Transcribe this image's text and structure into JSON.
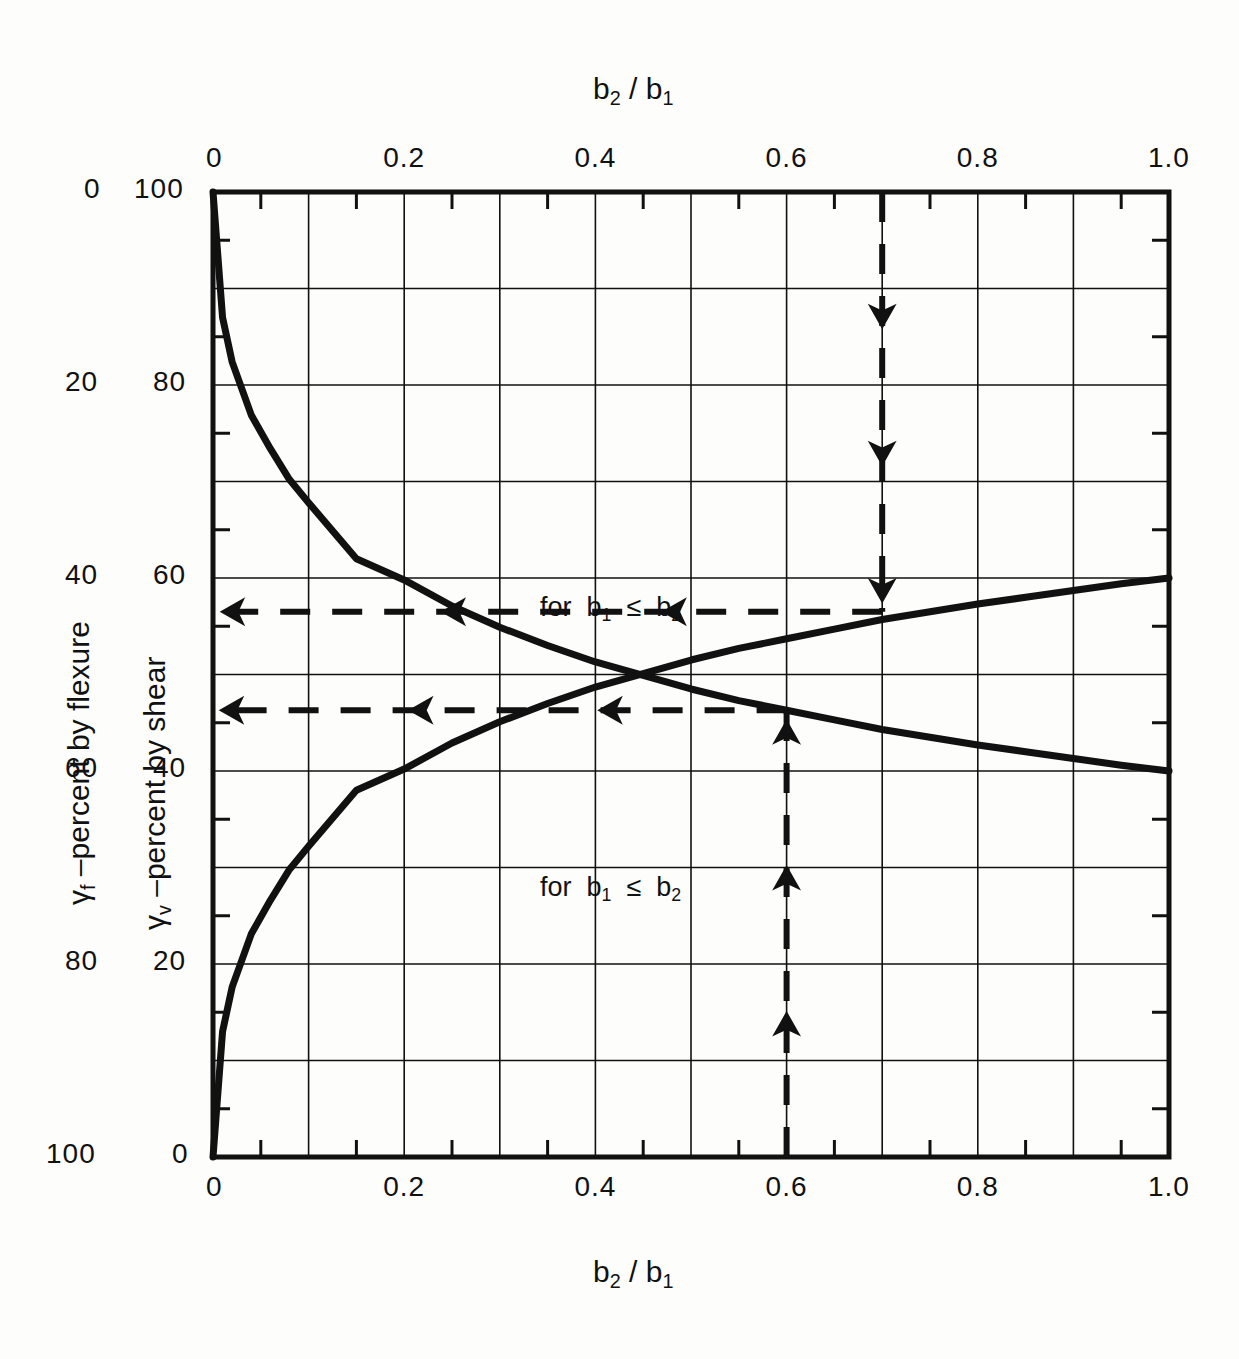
{
  "chart_data": {
    "type": "line",
    "title": "",
    "top_axis_label": "b2 / b1",
    "bottom_axis_label": "b2 / b1",
    "xlabel": "b2 / b1",
    "ylabel": "γv –percent by shear",
    "ylabel_outer": "γf –percent by flexure",
    "xlim": [
      0,
      1.0
    ],
    "ylim": [
      0,
      100
    ],
    "xticks": [
      0,
      0.2,
      0.4,
      0.6,
      0.8,
      1.0
    ],
    "xticklabels": [
      "0",
      "0.2",
      "0.4",
      "0.6",
      "0.8",
      "1.0"
    ],
    "x_major_grid_step": 0.1,
    "x_minor_tick_step": 0.05,
    "yticks_inner": [
      0,
      20,
      40,
      60,
      80,
      100
    ],
    "yticklabels_inner": [
      "0",
      "20",
      "40",
      "60",
      "80",
      "100"
    ],
    "yticks_outer": [
      100,
      80,
      60,
      40,
      20,
      0
    ],
    "yticklabels_outer": [
      "0",
      "20",
      "40",
      "60",
      "80",
      "100"
    ],
    "y_major_grid_step": 10,
    "y_minor_tick_step": 5,
    "grid": true,
    "legend": "none",
    "series": [
      {
        "name": "γv –percent by shear",
        "annotation": "for b1 ≤ b2",
        "formula": "gamma_v = 1 - 1/(1 + (2/3)*sqrt(b2/b1))",
        "x": [
          0.0,
          0.01,
          0.02,
          0.04,
          0.06,
          0.08,
          0.1,
          0.15,
          0.2,
          0.25,
          0.3,
          0.35,
          0.4,
          0.45,
          0.5,
          0.55,
          0.6,
          0.65,
          0.7,
          0.75,
          0.8,
          0.85,
          0.9,
          0.95,
          1.0
        ],
        "y": [
          100.0,
          87.0,
          82.4,
          76.9,
          73.4,
          70.2,
          67.8,
          62.0,
          59.8,
          57.1,
          54.9,
          53.0,
          51.3,
          49.9,
          48.5,
          47.3,
          46.3,
          45.3,
          44.3,
          43.5,
          42.7,
          42.0,
          41.3,
          40.6,
          40.0
        ]
      },
      {
        "name": "γf –percent by flexure (plotted on shear scale)",
        "annotation": "for b1 ≤ b2",
        "formula": "gamma_f = 1/(1 + (2/3)*sqrt(b2/b1))",
        "x": [
          0.0,
          0.01,
          0.02,
          0.04,
          0.06,
          0.08,
          0.1,
          0.15,
          0.2,
          0.25,
          0.3,
          0.35,
          0.4,
          0.45,
          0.5,
          0.55,
          0.6,
          0.65,
          0.7,
          0.75,
          0.8,
          0.85,
          0.9,
          0.95,
          1.0
        ],
        "y": [
          0.0,
          13.0,
          17.6,
          23.1,
          26.6,
          29.8,
          32.2,
          38.0,
          40.2,
          42.9,
          45.1,
          47.0,
          48.7,
          50.1,
          51.5,
          52.7,
          53.7,
          54.7,
          55.7,
          56.5,
          57.3,
          58.0,
          58.7,
          59.4,
          60.0
        ]
      }
    ],
    "annotations": [
      {
        "text": "for b1 ≤ b2",
        "x": 0.42,
        "y": 55.5,
        "name": "flexure-curve-annotation"
      },
      {
        "text": "for b1 ≤ b2",
        "x": 0.42,
        "y": 25.5,
        "name": "shear-curve-annotation"
      }
    ],
    "construction_arrows": [
      {
        "name": "vertical-down-arrow",
        "orientation": "vertical",
        "direction": "down",
        "x": 0.7,
        "y_start": 100,
        "y_end": 56.5,
        "style": "dashed"
      },
      {
        "name": "horizontal-left-arrow-upper",
        "orientation": "horizontal",
        "direction": "left",
        "y": 56.5,
        "x_start": 0.7,
        "x_end": 0.0,
        "style": "dashed"
      },
      {
        "name": "horizontal-left-arrow-lower",
        "orientation": "horizontal",
        "direction": "left",
        "y": 46.3,
        "x_start": 0.6,
        "x_end": 0.0,
        "style": "dashed"
      },
      {
        "name": "vertical-up-arrow",
        "orientation": "vertical",
        "direction": "up",
        "x": 0.6,
        "y_start": 0,
        "y_end": 46.3,
        "style": "dashed"
      }
    ],
    "colors": {
      "ink": "#111111",
      "grid": "#111111",
      "background": "#fdfdfb"
    }
  },
  "axes": {
    "top_title": "b₂ / b₁",
    "bottom_title": "b₂ / b₁",
    "left_outer_title_prefix": "γ",
    "left_outer_title_sub": "f",
    "left_outer_title_rest": "–percent by flexure",
    "left_inner_title_prefix": "γ",
    "left_inner_title_sub": "v",
    "left_inner_title_rest": "–percent by shear"
  },
  "annotation_text": {
    "for_prefix": "for",
    "b1": "b",
    "b1_sub": "1",
    "le": "≤",
    "b2": "b",
    "b2_sub": "2"
  }
}
